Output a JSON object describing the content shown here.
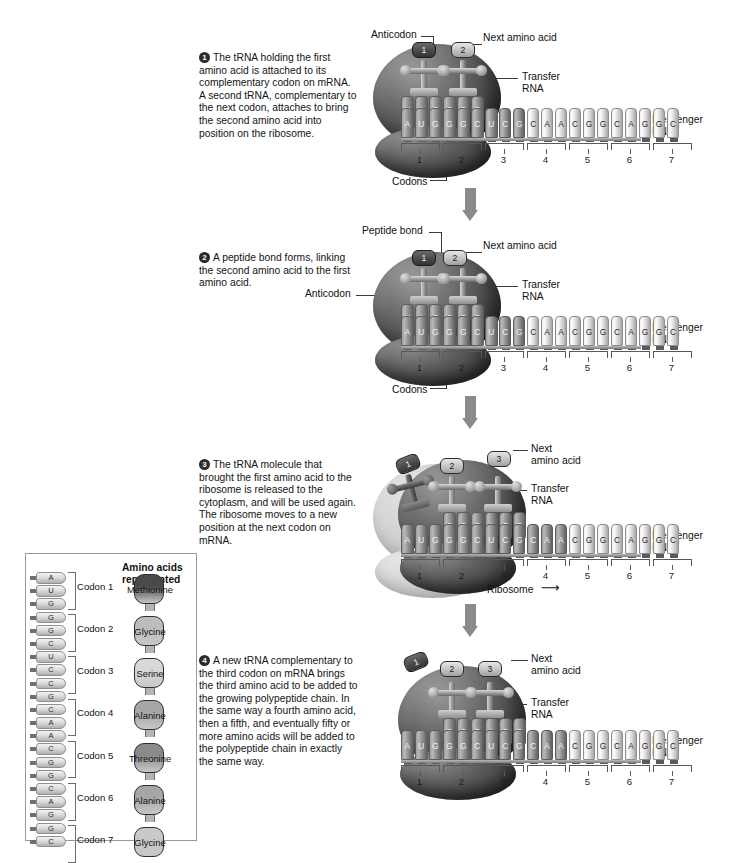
{
  "figure": {
    "ellipsis": "...",
    "ribosome_label": "Ribosome",
    "ribosome_arrow": "⟶"
  },
  "labels": {
    "anticodon": "Anticodon",
    "next_amino_acid": "Next amino acid",
    "next_amino_acid_l1": "Next",
    "next_amino_acid_l2": "amino acid",
    "transfer_rna_l1": "Transfer",
    "transfer_rna_l2": "RNA",
    "messenger_rna_l1": "Messenger",
    "messenger_rna_l2": "RNA",
    "codons": "Codons",
    "peptide_bond": "Peptide bond"
  },
  "steps": [
    {
      "number": "1",
      "text": "The tRNA holding the first amino acid is attached to its complementary codon on mRNA. A second tRNA, complementary to the next codon, attaches to bring the second amino acid into position on the ribosome."
    },
    {
      "number": "2",
      "text": "A peptide bond forms, linking the second amino acid to the first amino acid."
    },
    {
      "number": "3",
      "text": "The tRNA molecule that brought the first amino acid to the ribosome is released to the cytoplasm, and will be used again. The ribosome moves to a new position at the next codon on mRNA."
    },
    {
      "number": "4",
      "text": "A new tRNA complementary to the third codon on mRNA brings the third amino acid to be added to the growing polypeptide chain. In the same way a fourth amino acid, then a fifth, and eventually fifty or more amino acids will be added to the polypeptide chain in exactly the same way."
    }
  ],
  "mrna": {
    "sequence": [
      "A",
      "U",
      "G",
      "G",
      "G",
      "C",
      "U",
      "C",
      "G",
      "C",
      "A",
      "A",
      "C",
      "G",
      "G",
      "C",
      "A",
      "G",
      "G",
      "C"
    ],
    "codon_numbers": [
      "1",
      "2",
      "3",
      "4",
      "5",
      "6",
      "7"
    ]
  },
  "panels": {
    "step1": {
      "anticodon_bases": [
        "U",
        "A",
        "C",
        "C",
        "C",
        "G"
      ],
      "amino_acids": [
        "1",
        "2"
      ]
    },
    "step2": {
      "anticodon_bases": [
        "U",
        "A",
        "C",
        "C",
        "C",
        "G"
      ],
      "amino_acids": [
        "1",
        "2"
      ]
    },
    "step3": {
      "anticodon_bases_released": [
        "U",
        "A",
        "C"
      ],
      "anticodon_bases_bound": [
        "C",
        "C",
        "G"
      ],
      "anticodon_bases_new": [
        "A",
        "G",
        "G"
      ],
      "amino_acids": [
        "2",
        "3"
      ],
      "released_amino_acid": "1"
    },
    "step4": {
      "anticodon_bases_bound": [
        "C",
        "C",
        "G"
      ],
      "anticodon_bases_new": [
        "A",
        "G",
        "G"
      ],
      "amino_acids": [
        "2",
        "3"
      ],
      "released_amino_acid": "1"
    }
  },
  "legend": {
    "title_l1": "Amino acids",
    "title_l2": "represented",
    "codons": [
      {
        "label": "Codon 1",
        "bases": [
          "A",
          "U",
          "G"
        ],
        "amino_acid": "Methionine",
        "color": "#4a4a4a"
      },
      {
        "label": "Codon 2",
        "bases": [
          "G",
          "G",
          "C"
        ],
        "amino_acid": "Glycine",
        "color": "#bdbdbd"
      },
      {
        "label": "Codon 3",
        "bases": [
          "U",
          "C",
          "C"
        ],
        "amino_acid": "Serine",
        "color": "#d8d8d8"
      },
      {
        "label": "Codon 4",
        "bases": [
          "G",
          "C",
          "A"
        ],
        "amino_acid": "Alanine",
        "color": "#a6a6a6"
      },
      {
        "label": "Codon 5",
        "bases": [
          "A",
          "C",
          "G"
        ],
        "amino_acid": "Threonine",
        "color": "#8a8a8a"
      },
      {
        "label": "Codon 6",
        "bases": [
          "G",
          "C",
          "A"
        ],
        "amino_acid": "Alanine",
        "color": "#a6a6a6"
      },
      {
        "label": "Codon 7",
        "bases": [
          "G",
          "G",
          "C"
        ],
        "amino_acid": "Glycine",
        "color": "#c9c9c9"
      }
    ]
  }
}
